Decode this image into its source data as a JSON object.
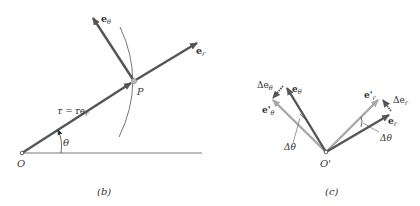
{
  "panels": [
    {
      "id": "b",
      "caption": "(b)",
      "labels": {
        "origin": "O",
        "point": "P",
        "position_vector": "r = re",
        "position_vector_sub": "r",
        "angle": "θ",
        "unit_radial": "e",
        "unit_radial_sub": "r",
        "unit_transverse": "e",
        "unit_transverse_sub": "θ"
      }
    },
    {
      "id": "c",
      "caption": "(c)",
      "labels": {
        "origin": "O'",
        "e_theta": "e",
        "e_theta_sub": "θ",
        "e_theta_prime": "e'",
        "e_theta_prime_sub": "θ",
        "delta_e_theta": "Δe",
        "delta_e_theta_sub": "θ",
        "delta_theta_left": "Δθ",
        "e_r": "e",
        "e_r_sub": "r",
        "e_r_prime": "e'",
        "e_r_prime_sub": "r",
        "delta_e_r": "Δe",
        "delta_e_r_sub": "r",
        "delta_theta_right": "Δθ"
      }
    }
  ],
  "colors": {
    "dark_vector": "#555555",
    "light_vector": "#a8a8a8",
    "line": "#777777",
    "text": "#333333"
  }
}
